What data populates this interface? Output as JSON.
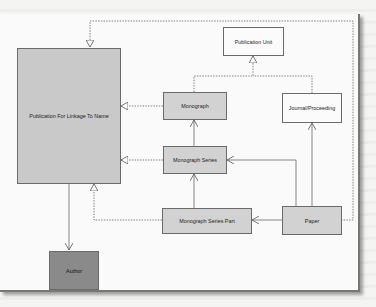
{
  "diagram": {
    "type": "UML class diagram",
    "nodes": {
      "publication_for_linkage": {
        "label": "Publication For Linkage To Name"
      },
      "publication_unit": {
        "label": "Publication Unit"
      },
      "monograph": {
        "label": "Monograph"
      },
      "journal_proceeding": {
        "label": "Journal/Proceeding"
      },
      "monograph_series": {
        "label": "Monograph Series"
      },
      "monograph_series_part": {
        "label": "Monograph Series Part"
      },
      "paper": {
        "label": "Paper"
      },
      "author": {
        "label": "Author"
      }
    },
    "edges": [
      {
        "from": "Monograph",
        "to": "Publication For Linkage To Name",
        "style": "dashed",
        "arrow": "hollow-triangle"
      },
      {
        "from": "Monograph Series",
        "to": "Publication For Linkage To Name",
        "style": "dashed",
        "arrow": "hollow-triangle"
      },
      {
        "from": "Monograph Series Part",
        "to": "Publication For Linkage To Name",
        "style": "dashed",
        "arrow": "hollow-triangle"
      },
      {
        "from": "Paper",
        "to": "Publication For Linkage To Name",
        "style": "dashed",
        "arrow": "hollow-triangle"
      },
      {
        "from": "Monograph",
        "to": "Publication Unit",
        "style": "dashed",
        "arrow": "hollow-triangle"
      },
      {
        "from": "Journal/Proceeding",
        "to": "Publication Unit",
        "style": "dashed",
        "arrow": "hollow-triangle"
      },
      {
        "from": "Monograph Series",
        "to": "Monograph",
        "style": "solid",
        "arrow": "open"
      },
      {
        "from": "Monograph Series Part",
        "to": "Monograph Series",
        "style": "solid",
        "arrow": "open"
      },
      {
        "from": "Paper",
        "to": "Monograph Series",
        "style": "solid",
        "arrow": "open"
      },
      {
        "from": "Paper",
        "to": "Journal/Proceeding",
        "style": "solid",
        "arrow": "open"
      },
      {
        "from": "Paper",
        "to": "Monograph Series Part",
        "style": "solid",
        "arrow": "open"
      },
      {
        "from": "Publication For Linkage To Name",
        "to": "Author",
        "style": "solid",
        "arrow": "open"
      }
    ],
    "colors": {
      "gray_box": "#d2d2d2",
      "big_box": "#c9c9c9",
      "white_box": "#fbfbfb",
      "author_box": "#8a8a8a",
      "line": "#555555"
    }
  }
}
